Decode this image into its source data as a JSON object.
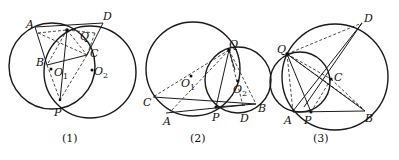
{
  "figures": [
    {
      "caption": "(1)",
      "labels": {
        "A": "A",
        "B": "B",
        "C": "C",
        "D": "D",
        "P": "P",
        "Q": "Q",
        "O1": "O",
        "O1_sub": "1",
        "O2": "O",
        "O2_sub": "2"
      }
    },
    {
      "caption": "(2)",
      "labels": {
        "A": "A",
        "B": "B",
        "C": "C",
        "D": "D",
        "P": "P",
        "Q": "Q",
        "O1": "O",
        "O1_sub": "1",
        "O2": "O",
        "O2_sub": "2"
      }
    },
    {
      "caption": "(3)",
      "labels": {
        "A": "A",
        "B": "B",
        "C": "C",
        "D": "D",
        "P": "P",
        "Q": "Q"
      }
    }
  ],
  "colors": {
    "stroke": "#1a1a1a",
    "background": "#ffffff"
  }
}
